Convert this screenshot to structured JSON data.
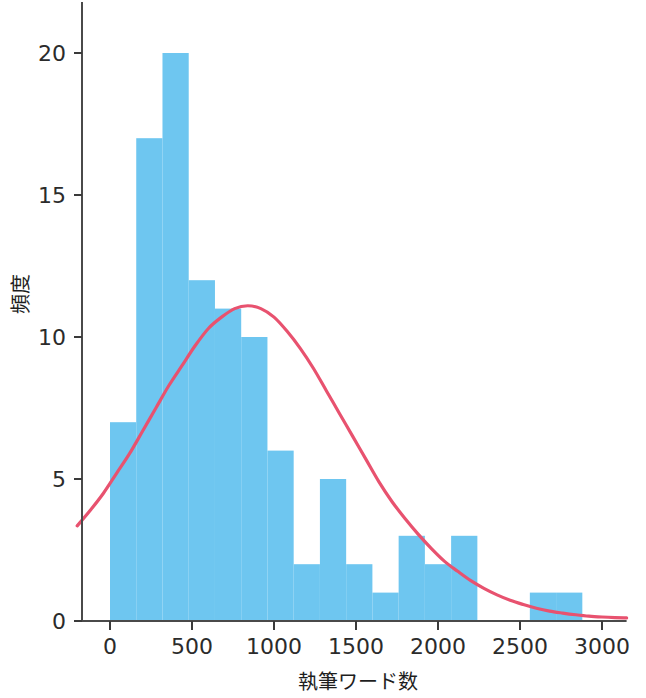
{
  "chart_data": {
    "type": "bar",
    "title": "",
    "xlabel": "執筆ワード数",
    "ylabel": "頻度",
    "xlim": [
      -200,
      3150
    ],
    "ylim": [
      0,
      21.2
    ],
    "xticks": [
      0,
      500,
      1000,
      1500,
      2000,
      2500,
      3000
    ],
    "xtick_labels": [
      "0",
      "500",
      "1000",
      "1500",
      "2000",
      "2500",
      "3000"
    ],
    "yticks": [
      0,
      5,
      10,
      15,
      20
    ],
    "ytick_labels": [
      "0",
      "5",
      "10",
      "15",
      "20"
    ],
    "grid": false,
    "legend": null,
    "bin_width": 160,
    "bin_edges": [
      0,
      160,
      320,
      480,
      640,
      800,
      960,
      1120,
      1280,
      1440,
      1600,
      1760,
      1920,
      2080,
      2240,
      2400,
      2560,
      2720,
      2880
    ],
    "categories": [
      "0-160",
      "160-320",
      "320-480",
      "480-640",
      "640-800",
      "800-960",
      "960-1120",
      "1120-1280",
      "1280-1440",
      "1440-1600",
      "1600-1760",
      "1760-1920",
      "1920-2080",
      "2080-2240",
      "2240-2400",
      "2400-2560",
      "2560-2720",
      "2720-2880"
    ],
    "values": [
      7,
      17,
      20,
      12,
      11,
      10,
      6,
      2,
      5,
      2,
      1,
      3,
      2,
      3,
      0,
      0,
      1,
      1
    ],
    "bar_color": "#6ec6f0",
    "curve": {
      "name": "density",
      "color": "#e8526f",
      "peak_x": 800,
      "peak_y": 11.1,
      "start_x": -200,
      "start_y": 3.4,
      "points": [
        [
          -200,
          3.35
        ],
        [
          -120,
          3.9
        ],
        [
          -40,
          4.5
        ],
        [
          40,
          5.2
        ],
        [
          120,
          5.9
        ],
        [
          200,
          6.7
        ],
        [
          280,
          7.5
        ],
        [
          360,
          8.3
        ],
        [
          440,
          9.0
        ],
        [
          520,
          9.7
        ],
        [
          600,
          10.3
        ],
        [
          680,
          10.7
        ],
        [
          760,
          11.0
        ],
        [
          840,
          11.1
        ],
        [
          920,
          11.0
        ],
        [
          1000,
          10.7
        ],
        [
          1080,
          10.2
        ],
        [
          1160,
          9.6
        ],
        [
          1240,
          8.9
        ],
        [
          1320,
          8.1
        ],
        [
          1400,
          7.3
        ],
        [
          1480,
          6.5
        ],
        [
          1560,
          5.7
        ],
        [
          1640,
          4.9
        ],
        [
          1720,
          4.2
        ],
        [
          1800,
          3.6
        ],
        [
          1880,
          3.05
        ],
        [
          1960,
          2.55
        ],
        [
          2040,
          2.1
        ],
        [
          2120,
          1.75
        ],
        [
          2200,
          1.42
        ],
        [
          2280,
          1.15
        ],
        [
          2360,
          0.92
        ],
        [
          2440,
          0.73
        ],
        [
          2520,
          0.58
        ],
        [
          2600,
          0.45
        ],
        [
          2680,
          0.35
        ],
        [
          2760,
          0.28
        ],
        [
          2840,
          0.22
        ],
        [
          2920,
          0.17
        ],
        [
          3000,
          0.14
        ],
        [
          3080,
          0.12
        ],
        [
          3150,
          0.11
        ]
      ]
    }
  },
  "axes": {
    "x_title": "執筆ワード数",
    "y_title": "頻度"
  }
}
